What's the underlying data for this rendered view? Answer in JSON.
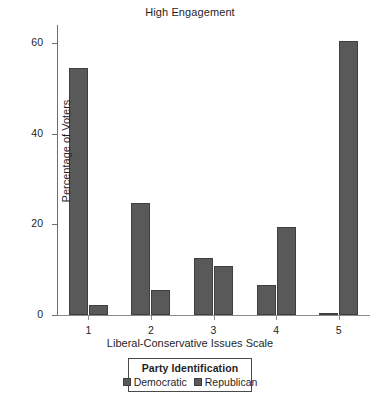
{
  "chart_data": {
    "type": "bar",
    "title": "High Engagement",
    "xlabel": "Liberal-Conservative Issues Scale",
    "ylabel": "Percentage of  Voters",
    "categories": [
      "1",
      "2",
      "3",
      "4",
      "5"
    ],
    "yticks": [
      "0",
      "20",
      "40",
      "60"
    ],
    "ytick_values": [
      0,
      20,
      40,
      60
    ],
    "ylim": [
      0,
      64
    ],
    "grid": false,
    "legend_position": "bottom",
    "legend_title": "Party Identification",
    "bar_color": "#595959",
    "bar_edge_color": "#3f3f3f",
    "series": [
      {
        "name": "Democratic",
        "values": [
          54.5,
          24.7,
          12.6,
          6.7,
          0.5
        ]
      },
      {
        "name": "Republican",
        "values": [
          2.3,
          5.5,
          10.8,
          19.4,
          60.5
        ]
      }
    ]
  },
  "legend": {
    "title": "Party Identification",
    "entries": [
      {
        "label": "Democratic",
        "swatch": "legend-swatch-democratic"
      },
      {
        "label": "Republican",
        "swatch": "legend-swatch-republican"
      }
    ]
  },
  "bottom_caption": ""
}
